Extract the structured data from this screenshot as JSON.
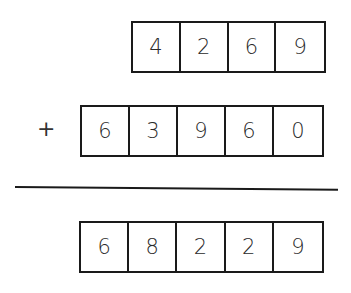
{
  "problem": {
    "operator": "+",
    "addend_1": [
      "4",
      "2",
      "6",
      "9"
    ],
    "addend_2": [
      "6",
      "3",
      "9",
      "6",
      "0"
    ],
    "result": [
      "6",
      "8",
      "2",
      "2",
      "9"
    ]
  }
}
